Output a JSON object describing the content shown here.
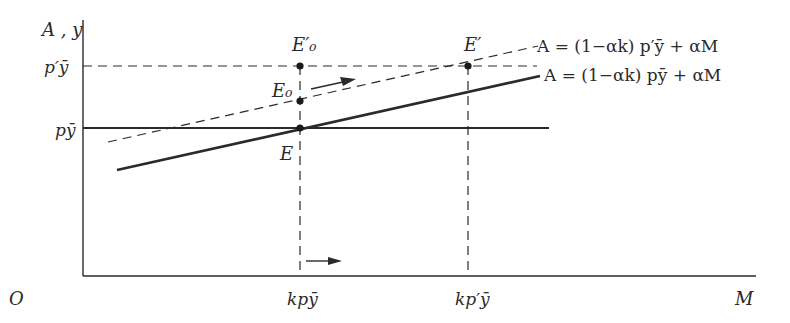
{
  "diagram": {
    "axes": {
      "y_label": "A , y",
      "x_label": "M",
      "origin_label": "O"
    },
    "y_ticks": [
      {
        "label": "p′ȳ",
        "y": 66
      },
      {
        "label": "pȳ",
        "y": 128
      }
    ],
    "x_ticks": [
      {
        "label": "kpȳ",
        "x": 300
      },
      {
        "label": "kp′ȳ",
        "x": 468
      }
    ],
    "points": [
      {
        "label": "E",
        "x": 300,
        "y": 128
      },
      {
        "label": "E₀",
        "x": 300,
        "y": 101
      },
      {
        "label": "E′₀",
        "x": 300,
        "y": 66
      },
      {
        "label": "E′",
        "x": 468,
        "y": 66
      }
    ],
    "curves": [
      {
        "name": "original",
        "style": "solid",
        "equation": "A = (1−αk) pȳ + αM"
      },
      {
        "name": "shifted",
        "style": "dashed",
        "equation": "A = (1−αk) p′ȳ + αM"
      }
    ],
    "colors": {
      "ink": "#2a2a2a",
      "background": "#ffffff"
    }
  }
}
